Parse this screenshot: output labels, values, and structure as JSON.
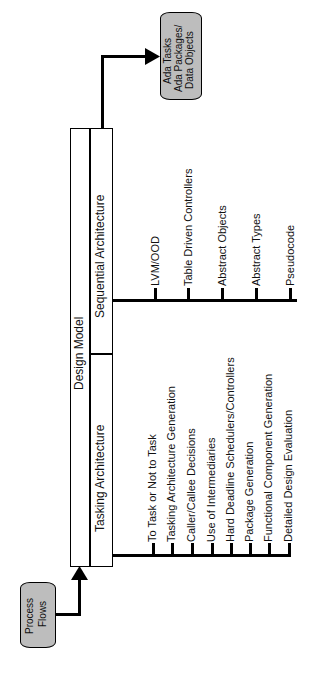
{
  "diagram": {
    "orientation": "rotated-90-ccw",
    "input_node": {
      "label_line1": "Process",
      "label_line2": "Flows"
    },
    "output_node": {
      "label_line1": "Ada Tasks",
      "label_line2": "Ada Packages/",
      "label_line3": "Data Objects"
    },
    "design_model": {
      "title": "Design Model",
      "sections": [
        {
          "title": "Tasking Architecture",
          "items": [
            "To Task or Not to Task",
            "Tasking Architecture Generation",
            "Caller/Callee Decisions",
            "Use of Intermediaries",
            "Hard Deadline Schedulers/Controllers",
            "Package Generation",
            "Functional Component Generation",
            "Detailed Design Evaluation"
          ]
        },
        {
          "title": "Sequential Architecture",
          "items": [
            "LVM/OOD",
            "Table Driven Controllers",
            "Abstract Objects",
            "Abstract Types",
            "Pseudocode"
          ]
        }
      ]
    },
    "colors": {
      "line": "#000000",
      "node_fill": "#bdbdbd",
      "background": "#ffffff"
    }
  }
}
